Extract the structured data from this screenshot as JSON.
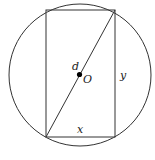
{
  "diagram": {
    "type": "geometry",
    "circle": {
      "cx": 80,
      "cy": 75,
      "r": 71,
      "stroke": "#333333"
    },
    "rectangle": {
      "x1": 46,
      "y1": 10,
      "x2": 115,
      "y2": 137,
      "stroke": "#333333"
    },
    "diagonal": {
      "from": [
        46,
        137
      ],
      "to": [
        115,
        10
      ]
    },
    "center_point": {
      "cx": 79.5,
      "cy": 74.5,
      "r": 2.6,
      "fill": "#000000"
    },
    "labels": {
      "diameter": "d",
      "center": "O",
      "height": "y",
      "width": "x"
    }
  }
}
